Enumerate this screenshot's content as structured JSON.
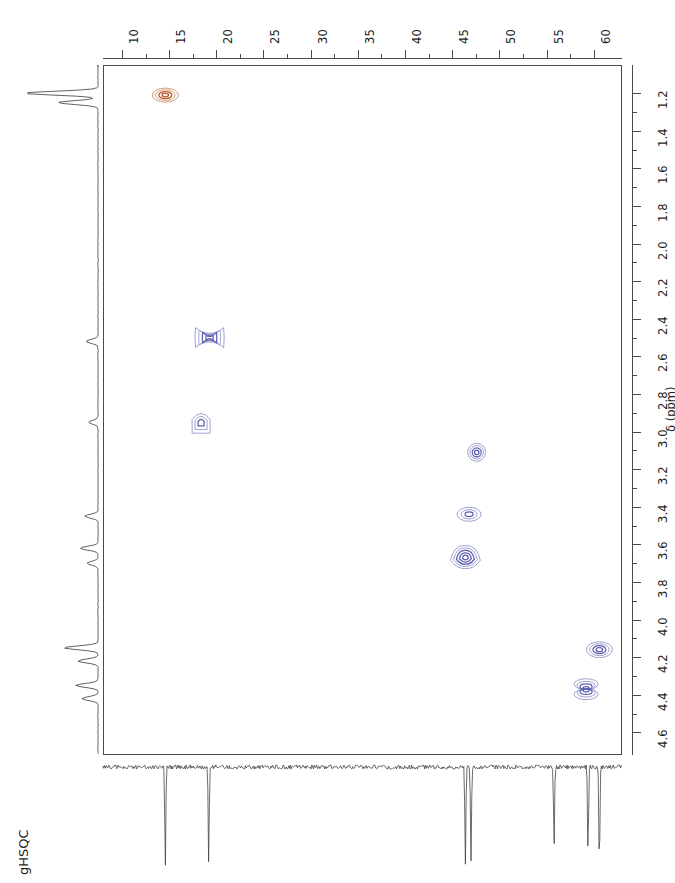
{
  "figure": {
    "experiment_label": "gHSQC",
    "type": "2D NMR HSQC contour plot",
    "width": 675,
    "height": 883
  },
  "axes": {
    "top": {
      "name": "carbon-13 chemical shift axis",
      "orientation": "horizontal-top",
      "ticks": [
        10,
        15,
        20,
        25,
        30,
        35,
        40,
        45,
        50,
        55,
        60
      ],
      "minor_per_interval": 1,
      "range": [
        8.0,
        63.0
      ],
      "direction": "left-to-right increasing"
    },
    "right": {
      "name": "proton chemical shift axis",
      "orientation": "vertical-right",
      "label": "δ (ppm)",
      "ticks": [
        1.2,
        1.4,
        1.6,
        1.8,
        2.0,
        2.2,
        2.4,
        2.6,
        2.8,
        3.0,
        3.2,
        3.4,
        3.6,
        3.8,
        4.0,
        4.2,
        4.4,
        4.6
      ],
      "range": [
        1.05,
        4.72
      ],
      "direction": "top-to-bottom increasing"
    }
  },
  "colors": {
    "contour_blue": "#5b5fae",
    "contour_blue_light": "#9ea1cf",
    "contour_orange": "#b35a32",
    "contour_orange_light": "#d79a78",
    "frame": "#4a4a4a",
    "trace": "#3a3a3a",
    "text": "#1e1e1e"
  },
  "chart_data": {
    "type": "scatter",
    "title": "gHSQC",
    "xlabel": "",
    "ylabel": "δ (ppm)",
    "xlim": [
      8.0,
      63.0
    ],
    "ylim": [
      1.05,
      4.72
    ],
    "grid": false,
    "legend": "none",
    "x_tick_labels": [
      "10",
      "15",
      "20",
      "25",
      "30",
      "35",
      "40",
      "45",
      "50",
      "55",
      "60"
    ],
    "y_tick_labels": [
      "1.2",
      "1.4",
      "1.6",
      "1.8",
      "2.0",
      "2.2",
      "2.4",
      "2.6",
      "2.8",
      "3.0",
      "3.2",
      "3.4",
      "3.6",
      "3.8",
      "4.0",
      "4.2",
      "4.4",
      "4.6"
    ],
    "cross_peaks": [
      {
        "id": "p1",
        "c13": 14.6,
        "h1": 1.21,
        "phase": "negative",
        "color": "orange",
        "rings": 4,
        "rx": 13,
        "ry": 7,
        "shape": "oval"
      },
      {
        "id": "p2",
        "c13": 19.3,
        "h1": 2.5,
        "phase": "positive",
        "color": "blue",
        "rings": 4,
        "rx": 14,
        "ry": 10,
        "shape": "hourglass"
      },
      {
        "id": "p3",
        "c13": 18.4,
        "h1": 2.95,
        "phase": "positive",
        "color": "blue",
        "rings": 3,
        "rx": 9,
        "ry": 11,
        "shape": "dome"
      },
      {
        "id": "p4",
        "c13": 47.6,
        "h1": 3.11,
        "phase": "positive",
        "color": "blue",
        "rings": 4,
        "rx": 9,
        "ry": 9,
        "shape": "round"
      },
      {
        "id": "p5",
        "c13": 46.8,
        "h1": 3.44,
        "phase": "positive",
        "color": "blue",
        "rings": 3,
        "rx": 12,
        "ry": 7,
        "shape": "oval"
      },
      {
        "id": "p6",
        "c13": 46.4,
        "h1": 3.67,
        "phase": "positive",
        "color": "blue",
        "rings": 5,
        "rx": 15,
        "ry": 11,
        "shape": "mushroom"
      },
      {
        "id": "p7",
        "c13": 60.6,
        "h1": 4.16,
        "phase": "positive",
        "color": "blue",
        "rings": 4,
        "rx": 13,
        "ry": 8,
        "shape": "oval"
      },
      {
        "id": "p8",
        "c13": 59.2,
        "h1": 4.37,
        "phase": "positive",
        "color": "blue",
        "rings": 4,
        "rx": 12,
        "ry": 12,
        "shape": "double"
      }
    ],
    "f2_projection": {
      "axis": "proton",
      "description": "1D proton trace along left edge, peaks pointing left",
      "peak_shifts": [
        1.2,
        1.25,
        2.52,
        2.95,
        3.45,
        3.62,
        3.7,
        4.15,
        4.22,
        4.35,
        4.42
      ]
    },
    "f1_projection": {
      "axis": "carbon-13",
      "description": "1D carbon trace along bottom edge, noisy baseline with downward spikes",
      "peak_shifts": [
        14.6,
        19.2,
        46.4,
        47.0,
        55.8,
        59.4,
        60.6
      ]
    }
  }
}
